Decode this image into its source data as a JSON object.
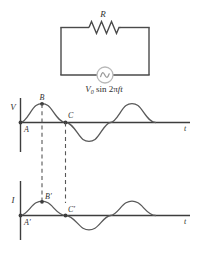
{
  "figure": {
    "circuit": {
      "resistor_label": "R",
      "source_label_parts": {
        "v": "V",
        "zero": "0",
        "sin": " sin 2",
        "pi": "π",
        "f": "f",
        "t": "t"
      },
      "source_label_full": "V0 sin 2πft",
      "source_symbol": "ac-source-sine"
    },
    "voltage_plot": {
      "y_axis_label": "V",
      "x_axis_label": "t",
      "points": [
        {
          "label": "A",
          "position": "origin"
        },
        {
          "label": "B",
          "position": "first-peak"
        },
        {
          "label": "C",
          "position": "first-zero-crossing"
        }
      ]
    },
    "current_plot": {
      "y_axis_label": "I",
      "x_axis_label": "t",
      "points": [
        {
          "label": "A′",
          "position": "origin"
        },
        {
          "label": "B′",
          "position": "first-peak"
        },
        {
          "label": "C′",
          "position": "first-zero-crossing"
        }
      ]
    },
    "colors": {
      "line": "#4a4a4a",
      "curve": "#595959",
      "axis": "#3d3d3d",
      "source": "#b0b0b0",
      "text": "#2f2f2f"
    }
  }
}
